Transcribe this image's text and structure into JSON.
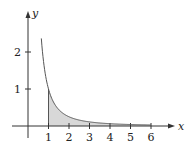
{
  "chart_data": {
    "type": "area",
    "title": "",
    "function": "y = 1/x^2",
    "xlabel": "x",
    "ylabel": "y",
    "x_ticks": [
      1,
      2,
      3,
      4,
      5,
      6
    ],
    "x_tick_labels": [
      "1",
      "2",
      "3",
      "4",
      "5",
      "6"
    ],
    "y_ticks": [
      1,
      2
    ],
    "y_tick_labels": [
      "1",
      "2"
    ],
    "xlim": [
      -0.6,
      7.1
    ],
    "ylim": [
      -0.4,
      3.1
    ],
    "grid": false,
    "legend": null,
    "curve": {
      "x_start": 0.65,
      "x_end": 6,
      "points": [
        [
          0.65,
          2.37
        ],
        [
          0.75,
          1.78
        ],
        [
          0.9,
          1.23
        ],
        [
          1,
          1.0
        ],
        [
          1.25,
          0.64
        ],
        [
          1.5,
          0.44
        ],
        [
          2,
          0.25
        ],
        [
          2.5,
          0.16
        ],
        [
          3,
          0.11
        ],
        [
          4,
          0.0625
        ],
        [
          5,
          0.04
        ],
        [
          6,
          0.028
        ]
      ]
    },
    "shaded_region": {
      "x_from": 1,
      "x_to": 6,
      "description": "area under y = 1/x^2 from x = 1"
    },
    "colors": {
      "curve": "#555555",
      "fill": "#d8d8d8",
      "axes": "#333333"
    }
  },
  "labels": {
    "x_axis": "x",
    "y_axis": "y",
    "x_ticks": [
      "1",
      "2",
      "3",
      "4",
      "5",
      "6"
    ],
    "y_ticks": [
      "1",
      "2"
    ]
  }
}
